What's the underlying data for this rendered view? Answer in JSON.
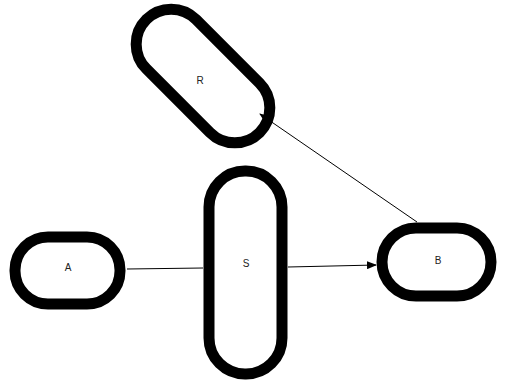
{
  "diagram": {
    "nodes": [
      {
        "id": "R",
        "label": "R"
      },
      {
        "id": "A",
        "label": "A"
      },
      {
        "id": "S",
        "label": "S"
      },
      {
        "id": "B",
        "label": "B"
      }
    ],
    "edges": [
      {
        "from": "A",
        "to": "S",
        "arrow": false
      },
      {
        "from": "S",
        "to": "B",
        "arrow": true
      },
      {
        "from": "B",
        "to": "R",
        "arrow": true
      }
    ],
    "colors": {
      "stroke": "#000000",
      "background": "#ffffff"
    }
  }
}
